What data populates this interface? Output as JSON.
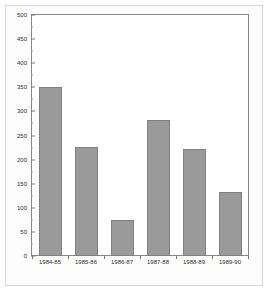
{
  "chart_data": {
    "type": "bar",
    "title": "",
    "subtitle": "",
    "xlabel": "",
    "ylabel": "",
    "categories": [
      "1984-85",
      "1985-86",
      "1986-87",
      "1987-88",
      "1988-89",
      "1989-90"
    ],
    "values": [
      350,
      227,
      75,
      283,
      221,
      133
    ],
    "series": [
      {
        "name": "",
        "values": [
          350,
          227,
          75,
          283,
          221,
          133
        ]
      }
    ],
    "ylim": [
      0,
      500
    ],
    "xlim": [
      0,
      6
    ],
    "ytick_labels": [
      "0",
      "50",
      "100",
      "150",
      "200",
      "250",
      "300",
      "350",
      "400",
      "450",
      "500"
    ],
    "ytick_values": [
      0,
      50,
      100,
      150,
      200,
      250,
      300,
      350,
      400,
      450,
      500
    ],
    "ytick_minor_values": [
      25,
      75,
      125,
      175,
      225,
      275,
      325,
      375,
      425,
      475
    ],
    "grid": false,
    "legend": null,
    "legend_position": "none",
    "annotations": [],
    "bar_color": "#9a9a9a",
    "bar_edge_color": "#808080",
    "axis_color": "#888888",
    "text_color": "#2b2b2b",
    "background_color": "#ffffff"
  }
}
